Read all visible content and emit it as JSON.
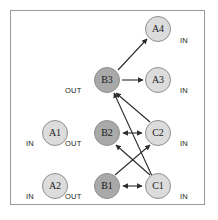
{
  "figure": {
    "background_color": "#ffffff",
    "border_color": "#9a9a9a",
    "edge_color": "#2b2b2b",
    "node_light_color": "#dcdcdc",
    "node_dark_color": "#a9a9a9",
    "node_stroke_color": "#8e8e8e"
  },
  "nodes": [
    {
      "id": "A4",
      "label": "A4",
      "x": 158,
      "y": 29,
      "fill": "light",
      "port": "IN",
      "port_x": 180,
      "port_y": 43
    },
    {
      "id": "B3",
      "label": "B3",
      "x": 107,
      "y": 80,
      "fill": "dark",
      "port": "OUT",
      "port_x": 78,
      "port_y": 93
    },
    {
      "id": "A3",
      "label": "A3",
      "x": 158,
      "y": 80,
      "fill": "light",
      "port": "IN",
      "port_x": 180,
      "port_y": 93
    },
    {
      "id": "A1",
      "label": "A1",
      "x": 55,
      "y": 133,
      "fill": "light",
      "port": "IN",
      "port_x": 33,
      "port_y": 146
    },
    {
      "id": "B2",
      "label": "B2",
      "x": 107,
      "y": 133,
      "fill": "dark",
      "port": "OUT",
      "port_x": 78,
      "port_y": 146
    },
    {
      "id": "C2",
      "label": "C2",
      "x": 158,
      "y": 133,
      "fill": "light",
      "port": "IN",
      "port_x": 180,
      "port_y": 146
    },
    {
      "id": "A2",
      "label": "A2",
      "x": 55,
      "y": 186,
      "fill": "light",
      "port": "IN",
      "port_x": 33,
      "port_y": 199
    },
    {
      "id": "B1",
      "label": "B1",
      "x": 107,
      "y": 186,
      "fill": "dark",
      "port": "OUT",
      "port_x": 78,
      "port_y": 199
    },
    {
      "id": "C1",
      "label": "C1",
      "x": 158,
      "y": 186,
      "fill": "light",
      "port": "IN",
      "port_x": 180,
      "port_y": 199
    }
  ],
  "edges": [
    {
      "from": "B3",
      "to": "A4",
      "direction": "one-way"
    },
    {
      "from": "B3",
      "to": "A3",
      "direction": "one-way"
    },
    {
      "from": "C2",
      "to": "B3",
      "direction": "one-way"
    },
    {
      "from": "C1",
      "to": "B3",
      "direction": "one-way"
    },
    {
      "from": "B2",
      "to": "C2",
      "direction": "two-way"
    },
    {
      "from": "B1",
      "to": "C1",
      "direction": "two-way"
    },
    {
      "from": "C1",
      "to": "B2",
      "direction": "one-way"
    },
    {
      "from": "B1",
      "to": "C2",
      "direction": "one-way"
    }
  ]
}
